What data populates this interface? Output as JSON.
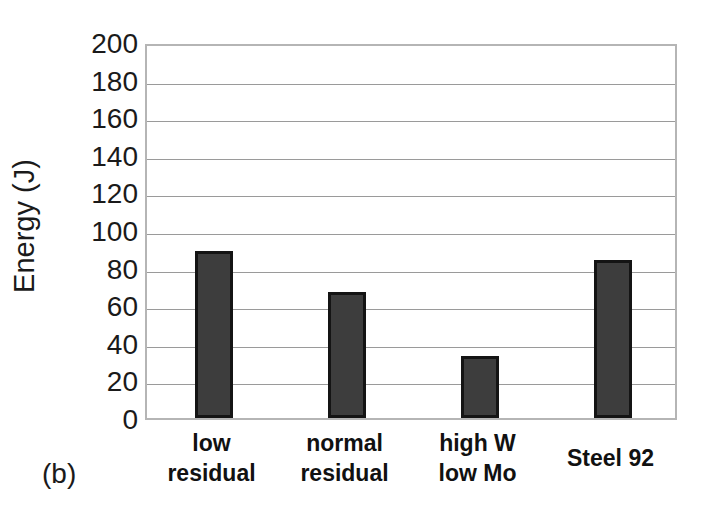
{
  "figure": {
    "panel_label": "(b)",
    "background_color": "#ffffff"
  },
  "chart_data": {
    "type": "bar",
    "title": "",
    "xlabel": "",
    "ylabel": "Energy (J)",
    "categories": [
      "low residual",
      "normal residual",
      "high W low Mo",
      "Steel 92"
    ],
    "category_lines": [
      [
        "low",
        "residual"
      ],
      [
        "normal",
        "residual"
      ],
      [
        "high W",
        "low Mo"
      ],
      [
        "Steel 92"
      ]
    ],
    "values": [
      89,
      67,
      33,
      84
    ],
    "ylim": [
      0,
      200
    ],
    "ytick_labels": [
      "200",
      "180",
      "160",
      "140",
      "120",
      "100",
      "80",
      "60",
      "40",
      "20",
      "0"
    ],
    "yticks": [
      200,
      180,
      160,
      140,
      120,
      100,
      80,
      60,
      40,
      20,
      0
    ],
    "ytick_step": 20,
    "grid": true,
    "grid_axis": "y",
    "grid_color": "#9a9a9a",
    "legend": null,
    "bar_fill_color": "#3d3d3d",
    "bar_edge_color": "#141414",
    "axis_border_color": "#b5b5b5"
  }
}
